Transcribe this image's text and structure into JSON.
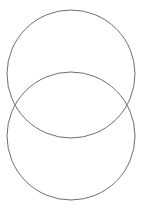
{
  "diagram": {
    "type": "venn-two-circles-vertical",
    "stroke_color": "#6e6e6e",
    "fill_color": "none",
    "background": "#ffffff",
    "circles": [
      {
        "name": "top-circle",
        "cx": 71,
        "cy": 74,
        "r": 64
      },
      {
        "name": "bottom-circle",
        "cx": 71,
        "cy": 136,
        "r": 64
      }
    ]
  }
}
